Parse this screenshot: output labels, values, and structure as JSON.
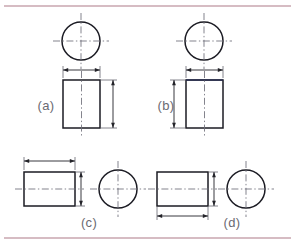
{
  "figure": {
    "canvas": {
      "width": 295,
      "height": 247,
      "background": "#ffffff"
    },
    "rules": {
      "top_rule_y": 6,
      "bottom_rule_y": 238,
      "color": "#c9a6af"
    },
    "colors": {
      "outline": "#1b1b23",
      "outline_accent": "#2a2f52",
      "centerline": "#6e6e78",
      "dimension": "#232329",
      "extension": "#5c5c66",
      "label": "#6a6a72",
      "rule": "#c9a6af"
    },
    "panels": [
      {
        "id": "a",
        "label": "(a)",
        "label_x": 46,
        "label_y": 107,
        "arrangement": "circle-above-rectangle",
        "circle": {
          "cx": 81,
          "cy": 41,
          "r": 19
        },
        "circle_centerline_extend": 9,
        "rectangle": {
          "x": 63,
          "y": 80,
          "width": 37,
          "height": 48
        },
        "rect_vertical_centerline": true,
        "rect_top_edge_accent": false,
        "dimensions": [
          {
            "name": "width-dimension",
            "orientation": "horizontal",
            "position": "top",
            "line_y": 70,
            "from": 63,
            "to": 100,
            "ext_from_y": 78,
            "ext_to_y": 66
          },
          {
            "name": "height-dimension",
            "orientation": "vertical",
            "position": "right",
            "line_x": 113,
            "from": 80,
            "to": 128,
            "ext_from_x": 101,
            "ext_to_x": 117
          }
        ]
      },
      {
        "id": "b",
        "label": "(b)",
        "label_x": 166,
        "label_y": 107,
        "arrangement": "circle-above-rectangle",
        "circle": {
          "cx": 204,
          "cy": 41,
          "r": 19
        },
        "circle_centerline_extend": 9,
        "rectangle": {
          "x": 186,
          "y": 80,
          "width": 37,
          "height": 48
        },
        "rect_vertical_centerline": true,
        "rect_top_edge_accent": true,
        "dimensions": [
          {
            "name": "width-dimension",
            "orientation": "horizontal",
            "position": "top",
            "line_y": 70,
            "from": 186,
            "to": 223,
            "ext_from_y": 78,
            "ext_to_y": 66
          },
          {
            "name": "height-dimension",
            "orientation": "vertical",
            "position": "left",
            "line_x": 174,
            "from": 80,
            "to": 128,
            "ext_from_x": 185,
            "ext_to_x": 170
          }
        ]
      },
      {
        "id": "c",
        "label": "(c)",
        "label_x": 89,
        "label_y": 224,
        "arrangement": "rectangle-left-circle-right",
        "circle": {
          "cx": 118,
          "cy": 189,
          "r": 19
        },
        "circle_centerline_extend": 9,
        "rectangle": {
          "x": 24,
          "y": 172,
          "width": 51,
          "height": 34
        },
        "rect_horizontal_centerline": true,
        "rect_top_edge_accent": false,
        "dimensions": [
          {
            "name": "length-dimension",
            "orientation": "horizontal",
            "position": "top",
            "line_y": 161,
            "from": 24,
            "to": 75,
            "ext_from_y": 170,
            "ext_to_y": 157
          },
          {
            "name": "diameter-dimension",
            "orientation": "vertical",
            "position": "right",
            "line_x": 81,
            "from": 172,
            "to": 206,
            "ext_from_x": 76,
            "ext_to_x": 85
          }
        ]
      },
      {
        "id": "d",
        "label": "(d)",
        "label_x": 232,
        "label_y": 224,
        "arrangement": "rectangle-left-circle-right",
        "circle": {
          "cx": 246,
          "cy": 189,
          "r": 19
        },
        "circle_centerline_extend": 9,
        "rectangle": {
          "x": 157,
          "y": 172,
          "width": 51,
          "height": 34
        },
        "rect_horizontal_centerline": true,
        "rect_top_edge_accent": false,
        "dimensions": [
          {
            "name": "length-dimension",
            "orientation": "horizontal",
            "position": "bottom",
            "line_y": 216,
            "from": 157,
            "to": 208,
            "ext_from_y": 207,
            "ext_to_y": 220
          },
          {
            "name": "diameter-dimension",
            "orientation": "vertical",
            "position": "right",
            "line_x": 214,
            "from": 172,
            "to": 206,
            "ext_from_x": 209,
            "ext_to_x": 218
          }
        ]
      }
    ]
  }
}
